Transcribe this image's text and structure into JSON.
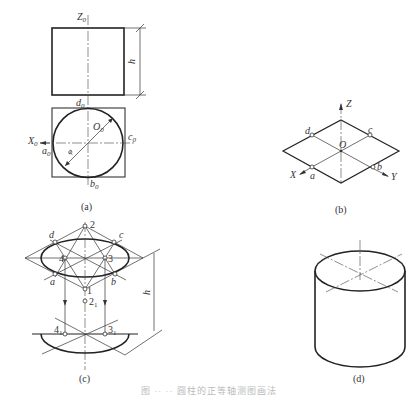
{
  "figure": {
    "panels": [
      {
        "id": "a",
        "caption": "(a)",
        "description": "Orthographic views of cylinder: front view rectangle and top view circle inscribed in square",
        "labels": {
          "z_axis": "Z",
          "z_sub": "0",
          "height": "h",
          "d": "d",
          "d_sub": "0",
          "o": "O",
          "o_sub": "0",
          "c": "c",
          "c_sub": "0",
          "x_axis": "X",
          "x_sub": "0",
          "a": "a",
          "a_sub": "0",
          "b": "b",
          "b_sub": "0",
          "diameter": "φ"
        }
      },
      {
        "id": "b",
        "caption": "(b)",
        "description": "Isometric axes with rhombus (projected square)",
        "labels": {
          "z_axis": "Z",
          "origin": "O",
          "x_axis": "X",
          "y_axis": "Y",
          "a": "a",
          "b": "b",
          "c": "c",
          "d": "d"
        }
      },
      {
        "id": "c",
        "caption": "(c)",
        "description": "Four-center approximate ellipse construction and translation by h",
        "labels": {
          "p1": "1",
          "p2": "2",
          "p3": "3",
          "p4": "4",
          "p2_1": "2",
          "p2_1_sub": "1",
          "p4_1": "4",
          "p4_1_sub": "1",
          "p3_1": "3",
          "p3_1_sub": "1",
          "a": "a",
          "b": "b",
          "c": "c",
          "d": "d",
          "height": "h"
        }
      },
      {
        "id": "d",
        "caption": "(d)",
        "description": "Completed isometric drawing of cylinder"
      }
    ],
    "bottom_caption": "图 ·· ·· 圆柱的正等轴测图画法"
  },
  "colors": {
    "line": "#222222",
    "background": "#ffffff"
  }
}
